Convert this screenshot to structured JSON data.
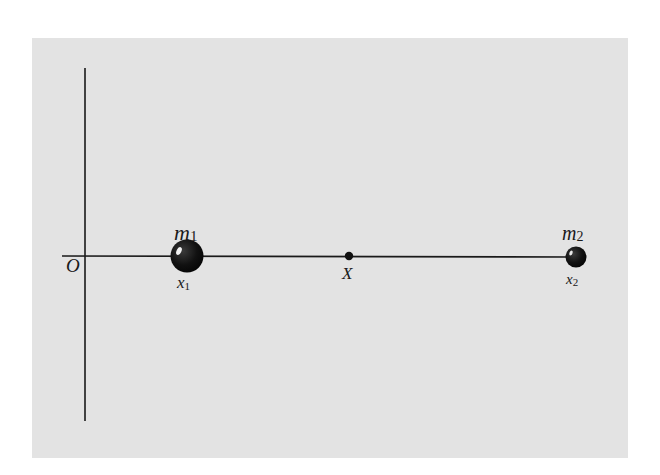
{
  "diagram": {
    "type": "center-of-mass-1d",
    "background_color": "#e3e3e3",
    "ink_color": "#1a1a1a",
    "origin": {
      "label": "O"
    },
    "axes": {
      "horizontal": "x-axis",
      "vertical": "y-axis"
    },
    "masses": [
      {
        "name": "m",
        "subscript": "1",
        "position_label": "x",
        "position_subscript": "1",
        "size": "large"
      },
      {
        "name": "m",
        "subscript": "2",
        "position_label": "x",
        "position_subscript": "2",
        "size": "small"
      }
    ],
    "center_of_mass": {
      "label": "X"
    }
  }
}
